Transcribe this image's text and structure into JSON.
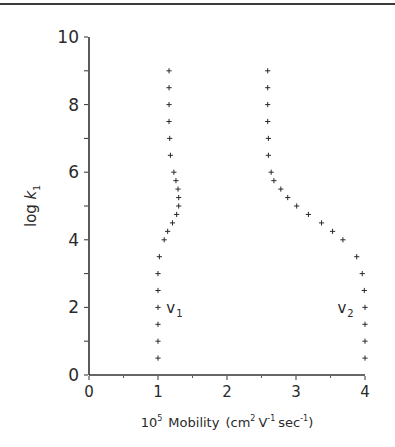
{
  "chart_data": {
    "type": "scatter",
    "title": "",
    "xlabel": "10^5 Mobility (cm^2 V^-1 sec^-1)",
    "xlabel_parts": {
      "prefix": "10",
      "prefix_sup": "5",
      "word": "Mobility",
      "unit_open": "(cm",
      "unit_sup1": "2",
      "unit_v": "V",
      "unit_sup2": "-1",
      "unit_sec": "sec",
      "unit_sup3": "-1",
      "unit_close": ")"
    },
    "ylabel": "log k1",
    "ylabel_parts": {
      "main": "log ",
      "var": "k",
      "sub": "1"
    },
    "xlim": [
      0,
      4
    ],
    "ylim": [
      0,
      10
    ],
    "x_ticks": [
      0,
      1,
      2,
      3,
      4
    ],
    "x_tick_labels": [
      "0",
      "1",
      "2",
      "3",
      "4"
    ],
    "x_minor_ticks": [
      0.5,
      1.5,
      2.5,
      3.5
    ],
    "y_ticks": [
      0,
      2,
      4,
      6,
      8,
      10
    ],
    "y_tick_labels": [
      "0",
      "2",
      "4",
      "6",
      "8",
      "10"
    ],
    "y_minor_ticks": [
      1,
      3,
      5,
      7,
      9
    ],
    "grid": false,
    "legend": "none",
    "marker": "+",
    "series": [
      {
        "name": "v1",
        "label": "v",
        "label_sub": "1",
        "label_pos": {
          "x": 1.12,
          "y": 1.95
        },
        "points": [
          {
            "log_k": 9.0,
            "mobility": 1.16
          },
          {
            "log_k": 8.5,
            "mobility": 1.16
          },
          {
            "log_k": 8.0,
            "mobility": 1.16
          },
          {
            "log_k": 7.5,
            "mobility": 1.16
          },
          {
            "log_k": 7.0,
            "mobility": 1.17
          },
          {
            "log_k": 6.5,
            "mobility": 1.18
          },
          {
            "log_k": 6.0,
            "mobility": 1.23
          },
          {
            "log_k": 5.75,
            "mobility": 1.26
          },
          {
            "log_k": 5.5,
            "mobility": 1.29
          },
          {
            "log_k": 5.25,
            "mobility": 1.3
          },
          {
            "log_k": 5.0,
            "mobility": 1.3
          },
          {
            "log_k": 4.75,
            "mobility": 1.27
          },
          {
            "log_k": 4.5,
            "mobility": 1.21
          },
          {
            "log_k": 4.25,
            "mobility": 1.14
          },
          {
            "log_k": 4.0,
            "mobility": 1.09
          },
          {
            "log_k": 3.5,
            "mobility": 1.02
          },
          {
            "log_k": 3.0,
            "mobility": 1.0
          },
          {
            "log_k": 2.5,
            "mobility": 1.0
          },
          {
            "log_k": 2.0,
            "mobility": 1.0
          },
          {
            "log_k": 1.5,
            "mobility": 1.0
          },
          {
            "log_k": 1.0,
            "mobility": 1.0
          },
          {
            "log_k": 0.5,
            "mobility": 1.0
          }
        ]
      },
      {
        "name": "v2",
        "label": "v",
        "label_sub": "2",
        "label_pos": {
          "x": 3.6,
          "y": 1.95
        },
        "points": [
          {
            "log_k": 9.0,
            "mobility": 2.59
          },
          {
            "log_k": 8.5,
            "mobility": 2.59
          },
          {
            "log_k": 8.0,
            "mobility": 2.59
          },
          {
            "log_k": 7.5,
            "mobility": 2.59
          },
          {
            "log_k": 7.0,
            "mobility": 2.6
          },
          {
            "log_k": 6.5,
            "mobility": 2.6
          },
          {
            "log_k": 6.0,
            "mobility": 2.64
          },
          {
            "log_k": 5.75,
            "mobility": 2.68
          },
          {
            "log_k": 5.5,
            "mobility": 2.78
          },
          {
            "log_k": 5.25,
            "mobility": 2.88
          },
          {
            "log_k": 5.0,
            "mobility": 3.01
          },
          {
            "log_k": 4.75,
            "mobility": 3.18
          },
          {
            "log_k": 4.5,
            "mobility": 3.37
          },
          {
            "log_k": 4.25,
            "mobility": 3.53
          },
          {
            "log_k": 4.0,
            "mobility": 3.68
          },
          {
            "log_k": 3.5,
            "mobility": 3.88
          },
          {
            "log_k": 3.0,
            "mobility": 3.96
          },
          {
            "log_k": 2.5,
            "mobility": 3.99
          },
          {
            "log_k": 2.0,
            "mobility": 4.0
          },
          {
            "log_k": 1.5,
            "mobility": 4.0
          },
          {
            "log_k": 1.0,
            "mobility": 4.0
          },
          {
            "log_k": 0.5,
            "mobility": 4.0
          }
        ]
      }
    ]
  },
  "colors": {
    "ink": "#2a2a2a",
    "axis": "#333333",
    "background": "#ffffff",
    "rule": "#3a3a3a"
  }
}
